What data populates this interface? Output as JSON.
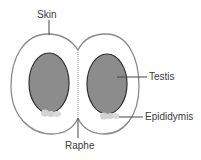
{
  "diagram": {
    "type": "anatomical cross-section",
    "labels": {
      "skin": "Skin",
      "testis": "Testis",
      "epididymis": "Epididymis",
      "raphe": "Raphe"
    },
    "colors": {
      "outline": "#8a8a8a",
      "testis_fill": "#8c8c8c",
      "testis_stroke": "#2e2e2e",
      "epididymis_fill": "#d2d2d2",
      "leader_line": "#444444",
      "text": "#3a3a3a",
      "background": "#ffffff"
    }
  }
}
